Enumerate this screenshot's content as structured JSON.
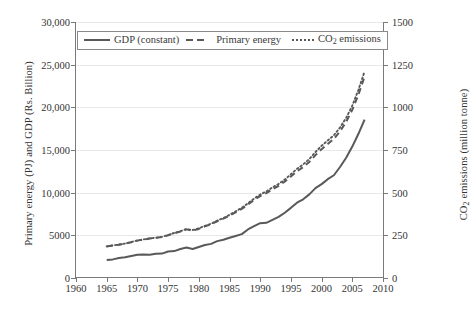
{
  "chart_data": {
    "type": "line",
    "title": "",
    "xlabel": "",
    "ylabel": "Primary energy (PJ) and GDP (Rs. Billion)",
    "y2label": "CO2 emissions (million tonne)",
    "xlim": [
      1960,
      2010
    ],
    "ylim": [
      0,
      30000
    ],
    "y2lim": [
      0,
      1500
    ],
    "grid": true,
    "legend_position": "top-left-inside",
    "xticks": [
      "1960",
      "1965",
      "1970",
      "1975",
      "1980",
      "1985",
      "1990",
      "1995",
      "2000",
      "2005",
      "2010"
    ],
    "yticks_left": [
      "0",
      "5000",
      "10,000",
      "15,000",
      "20,000",
      "25,000",
      "30,000"
    ],
    "yticks_right": [
      "0",
      "250",
      "500",
      "750",
      "1000",
      "1250",
      "1500"
    ],
    "series": [
      {
        "name": "GDP (constant)",
        "axis": "left",
        "style": "solid",
        "color": "#595959",
        "x": [
          1965,
          1966,
          1967,
          1968,
          1969,
          1970,
          1971,
          1972,
          1973,
          1974,
          1975,
          1976,
          1977,
          1978,
          1979,
          1980,
          1981,
          1982,
          1983,
          1984,
          1985,
          1986,
          1987,
          1988,
          1989,
          1990,
          1991,
          1992,
          1993,
          1994,
          1995,
          1996,
          1997,
          1998,
          1999,
          2000,
          2001,
          2002,
          2003,
          2004,
          2005,
          2006,
          2007
        ],
        "values": [
          2100,
          2180,
          2350,
          2420,
          2580,
          2720,
          2740,
          2720,
          2840,
          2860,
          3110,
          3150,
          3390,
          3580,
          3400,
          3640,
          3860,
          4000,
          4320,
          4480,
          4720,
          4930,
          5140,
          5690,
          6070,
          6420,
          6460,
          6810,
          7160,
          7650,
          8220,
          8830,
          9220,
          9800,
          10530,
          11000,
          11580,
          12040,
          13010,
          14100,
          15400,
          16900,
          18550
        ],
        "values_note": "indexed Rs. Billion; curve rises steeply after 2000 toward ~29,000 at 2007"
      },
      {
        "name": "Primary energy",
        "axis": "left",
        "style": "dashed",
        "color": "#595959",
        "x": [
          1965,
          1966,
          1967,
          1968,
          1969,
          1970,
          1971,
          1972,
          1973,
          1974,
          1975,
          1976,
          1977,
          1978,
          1979,
          1980,
          1981,
          1982,
          1983,
          1984,
          1985,
          1986,
          1987,
          1988,
          1989,
          1990,
          1991,
          1992,
          1993,
          1994,
          1995,
          1996,
          1997,
          1998,
          1999,
          2000,
          2001,
          2002,
          2003,
          2004,
          2005,
          2006,
          2007
        ],
        "values": [
          3700,
          3820,
          3900,
          4020,
          4200,
          4380,
          4500,
          4620,
          4700,
          4800,
          5000,
          5250,
          5450,
          5700,
          5550,
          5750,
          6050,
          6300,
          6650,
          6950,
          7300,
          7700,
          8100,
          8600,
          9150,
          9600,
          9950,
          10400,
          10800,
          11300,
          11900,
          12500,
          13000,
          13600,
          14400,
          15100,
          15700,
          16300,
          17200,
          18300,
          19700,
          21500,
          23600
        ]
      },
      {
        "name": "CO2 emissions",
        "axis": "right",
        "style": "dotted",
        "color": "#595959",
        "x": [
          1965,
          1966,
          1967,
          1968,
          1969,
          1970,
          1971,
          1972,
          1973,
          1974,
          1975,
          1976,
          1977,
          1978,
          1979,
          1980,
          1981,
          1982,
          1983,
          1984,
          1985,
          1986,
          1987,
          1988,
          1989,
          1990,
          1991,
          1992,
          1993,
          1994,
          1995,
          1996,
          1997,
          1998,
          1999,
          2000,
          2001,
          2002,
          2003,
          2004,
          2005,
          2006,
          2007
        ],
        "values": [
          185,
          191,
          196,
          202,
          211,
          220,
          226,
          232,
          236,
          241,
          252,
          264,
          274,
          287,
          281,
          291,
          306,
          318,
          336,
          351,
          370,
          390,
          412,
          437,
          465,
          489,
          507,
          531,
          551,
          577,
          608,
          640,
          666,
          697,
          738,
          775,
          806,
          836,
          882,
          938,
          1010,
          1103,
          1210
        ]
      }
    ]
  },
  "legend": {
    "items": [
      {
        "label": "GDP (constant)",
        "style": "solid"
      },
      {
        "label": "Primary energy",
        "style": "dashed"
      },
      {
        "label": "CO",
        "sub": "2",
        "label2": " emissions",
        "style": "dotted"
      }
    ]
  },
  "axes": {
    "left_title_a": "Primary energy (PJ) and GDP (Rs. Billion)",
    "right_title_a": "CO",
    "right_title_sub": "2",
    "right_title_b": " emissions (million tonne)"
  }
}
